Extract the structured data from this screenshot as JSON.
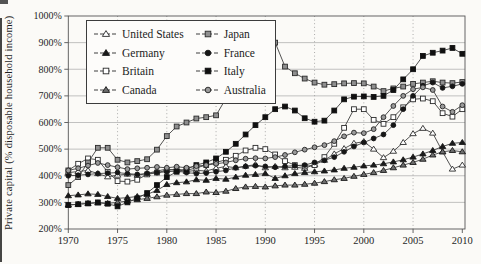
{
  "figure": {
    "y_axis_label": "Private capital (% disposable household income)"
  },
  "chart_data": {
    "type": "line",
    "title": "",
    "xlabel": "",
    "ylabel": "Private capital (% disposable household income)",
    "ylim": [
      200,
      1000
    ],
    "grid": true,
    "legend_position": "top-left-inside",
    "x_years": {
      "start": 1970,
      "end": 2010,
      "step": 1
    },
    "y_ticks": [
      {
        "v": 1000,
        "label": "1000%"
      },
      {
        "v": 900,
        "label": "900%"
      },
      {
        "v": 800,
        "label": "800%"
      },
      {
        "v": 700,
        "label": "700%"
      },
      {
        "v": 600,
        "label": "600%"
      },
      {
        "v": 500,
        "label": "500%"
      },
      {
        "v": 400,
        "label": "400%"
      },
      {
        "v": 300,
        "label": "300%"
      },
      {
        "v": 200,
        "label": "200%"
      }
    ],
    "x_ticks": [
      {
        "v": 1970,
        "label": "1970"
      },
      {
        "v": 1975,
        "label": "1975"
      },
      {
        "v": 1980,
        "label": "1980"
      },
      {
        "v": 1985,
        "label": "1985"
      },
      {
        "v": 1990,
        "label": "1990"
      },
      {
        "v": 1995,
        "label": "1995"
      },
      {
        "v": 2000,
        "label": "2000"
      },
      {
        "v": 2005,
        "label": "2005"
      },
      {
        "v": 2010,
        "label": "2010"
      }
    ],
    "colors": {
      "line": "#3f3f3f",
      "axis": "#555555",
      "grid_h": "#9a9a9a",
      "grid_v": "#8a8a8a",
      "black_marker": "#161616",
      "gray_marker": "#8f8f8f",
      "open_marker_fill": "#ffffff"
    },
    "series": [
      {
        "name": "United States",
        "marker": "triangle-open",
        "fill": "#ffffff",
        "stroke": "#2a2a2a",
        "values": [
          412,
          416,
          420,
          408,
          396,
          402,
          406,
          402,
          408,
          418,
          425,
          420,
          416,
          420,
          418,
          428,
          435,
          430,
          436,
          442,
          430,
          435,
          430,
          432,
          428,
          442,
          458,
          482,
          502,
          522,
          528,
          500,
          468,
          492,
          525,
          558,
          578,
          560,
          490,
          425,
          440
        ]
      },
      {
        "name": "Germany",
        "marker": "triangle-filled",
        "fill": "#1a1a1a",
        "stroke": "#1a1a1a",
        "values": [
          325,
          328,
          332,
          330,
          322,
          315,
          318,
          322,
          330,
          345,
          367,
          374,
          377,
          385,
          383,
          390,
          387,
          395,
          402,
          405,
          408,
          390,
          400,
          408,
          412,
          415,
          418,
          422,
          428,
          432,
          437,
          440,
          445,
          452,
          460,
          470,
          482,
          495,
          510,
          522,
          525
        ]
      },
      {
        "name": "Britain",
        "marker": "square-open",
        "fill": "#ffffff",
        "stroke": "#2a2a2a",
        "values": [
          420,
          445,
          465,
          460,
          415,
          380,
          378,
          385,
          405,
          412,
          420,
          425,
          420,
          430,
          440,
          450,
          460,
          475,
          495,
          505,
          500,
          480,
          455,
          440,
          435,
          440,
          470,
          520,
          580,
          650,
          650,
          610,
          595,
          620,
          657,
          687,
          690,
          680,
          635,
          622,
          650
        ]
      },
      {
        "name": "Canada",
        "marker": "triangle-filled",
        "fill": "#6e6e6e",
        "stroke": "#161616",
        "values": [
          290,
          293,
          296,
          298,
          296,
          300,
          305,
          310,
          315,
          321,
          327,
          330,
          333,
          333,
          339,
          337,
          342,
          352,
          358,
          360,
          358,
          362,
          365,
          365,
          368,
          372,
          378,
          385,
          390,
          398,
          405,
          412,
          420,
          430,
          440,
          450,
          462,
          478,
          490,
          495,
          490
        ]
      },
      {
        "name": "Japan",
        "marker": "square-filled",
        "fill": "#8f8f8f",
        "stroke": "#2a2a2a",
        "values": [
          365,
          395,
          450,
          505,
          505,
          460,
          450,
          455,
          462,
          498,
          549,
          585,
          600,
          615,
          620,
          627,
          690,
          810,
          880,
          950,
          960,
          900,
          810,
          785,
          765,
          750,
          742,
          744,
          747,
          748,
          747,
          735,
          718,
          728,
          735,
          745,
          750,
          755,
          750,
          748,
          752
        ]
      },
      {
        "name": "France",
        "marker": "circle-filled",
        "fill": "#161616",
        "stroke": "#161616",
        "values": [
          400,
          402,
          405,
          408,
          410,
          412,
          408,
          405,
          408,
          412,
          415,
          418,
          412,
          408,
          410,
          415,
          420,
          430,
          435,
          438,
          435,
          432,
          435,
          438,
          440,
          450,
          458,
          470,
          490,
          510,
          525,
          540,
          555,
          590,
          650,
          700,
          738,
          750,
          730,
          736,
          745
        ]
      },
      {
        "name": "Italy",
        "marker": "square-filled",
        "fill": "#101010",
        "stroke": "#101010",
        "values": [
          290,
          293,
          296,
          300,
          295,
          285,
          300,
          315,
          335,
          365,
          395,
          415,
          425,
          440,
          450,
          465,
          490,
          520,
          555,
          590,
          620,
          650,
          660,
          645,
          616,
          603,
          607,
          645,
          687,
          697,
          698,
          696,
          700,
          722,
          762,
          800,
          850,
          862,
          870,
          880,
          858
        ]
      },
      {
        "name": "Australia",
        "marker": "circle-filled",
        "fill": "#9a9a9a",
        "stroke": "#222222",
        "values": [
          420,
          428,
          438,
          448,
          440,
          432,
          425,
          428,
          430,
          433,
          430,
          434,
          430,
          436,
          440,
          445,
          450,
          458,
          464,
          466,
          465,
          470,
          478,
          488,
          498,
          507,
          515,
          530,
          548,
          562,
          560,
          575,
          620,
          662,
          700,
          725,
          732,
          722,
          660,
          640,
          665
        ]
      }
    ],
    "legend_columns": [
      [
        0,
        1,
        2,
        3
      ],
      [
        4,
        5,
        6,
        7
      ]
    ]
  }
}
